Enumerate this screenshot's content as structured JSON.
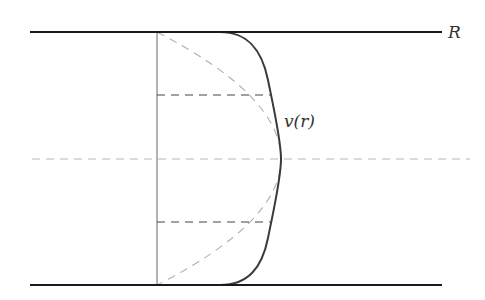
{
  "diagram": {
    "type": "pipe-flow-velocity-profile",
    "labels": {
      "radius": "R",
      "velocity": "v(r)"
    },
    "colors": {
      "wall": "#1a1a1a",
      "profile": "#3a3a3a",
      "axis": "#666666",
      "parabola": "#b0b0b0",
      "centerline": "#b8b8b8",
      "dashes": "#444444",
      "background": "#ffffff"
    },
    "elements": {
      "top_wall": "pipe wall at r = R",
      "bottom_wall": "pipe wall at r = -R",
      "centerline": "pipe axis (dashed)",
      "reference_axis": "vertical reference line (v = 0)",
      "solid_profile": "blunt velocity profile v(r)",
      "dashed_profile": "parabolic (laminar) reference profile",
      "upper_marker": "horizontal dashed line (upper)",
      "lower_marker": "horizontal dashed line (lower)"
    }
  }
}
